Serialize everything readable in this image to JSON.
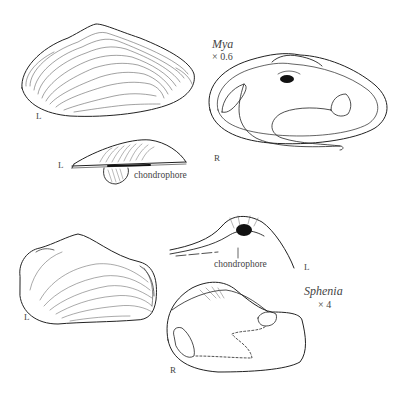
{
  "figure": {
    "colors": {
      "ink": "#222222",
      "background": "#ffffff",
      "label": "#444444"
    },
    "mya": {
      "genus": "Mya",
      "scale": "× 0.6",
      "external_view_side": "L",
      "interior_view_side": "R",
      "hinge_detail_side": "L",
      "hinge_label": "chondrophore"
    },
    "sphenia": {
      "genus": "Sphenia",
      "scale": "× 4",
      "external_view_side": "L",
      "hinge_detail_side": "L",
      "hinge_label": "chondrophore",
      "interior_view_side": "R"
    }
  }
}
